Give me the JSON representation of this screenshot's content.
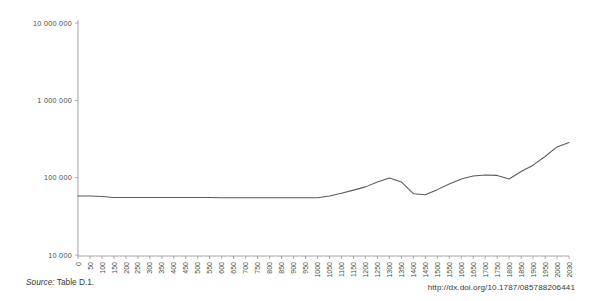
{
  "footer": {
    "source_word": "Source:",
    "source_ref": " Table D.1.",
    "doi": "http://dx.doi.org/10.1787/085788206441"
  },
  "chart_data": {
    "type": "line",
    "title": "",
    "subtitle": "",
    "xlabel": "",
    "ylabel": "",
    "grid": false,
    "legend": null,
    "yscale": "log",
    "ylim": [
      10000,
      10000000
    ],
    "ytick_labels": [
      "10 000 000",
      "1 000 000",
      "100 000",
      "10 000"
    ],
    "ytick_values": [
      10000000,
      1000000,
      100000,
      10000
    ],
    "xlim": [
      0,
      2030
    ],
    "xtick_labels": [
      "0",
      "50",
      "100",
      "150",
      "200",
      "250",
      "300",
      "350",
      "400",
      "450",
      "500",
      "550",
      "600",
      "650",
      "700",
      "750",
      "800",
      "850",
      "900",
      "950",
      "1000",
      "1050",
      "1100",
      "1150",
      "1200",
      "1250",
      "1300",
      "1350",
      "1400",
      "1450",
      "1500",
      "1550",
      "1600",
      "1650",
      "1700",
      "1750",
      "1800",
      "1850",
      "1900",
      "1950",
      "2000",
      "2030"
    ],
    "xtick_values": [
      0,
      50,
      100,
      150,
      200,
      250,
      300,
      350,
      400,
      450,
      500,
      550,
      600,
      650,
      700,
      750,
      800,
      850,
      900,
      950,
      1000,
      1050,
      1100,
      1150,
      1200,
      1250,
      1300,
      1350,
      1400,
      1450,
      1500,
      1550,
      1600,
      1650,
      1700,
      1750,
      1800,
      1850,
      1900,
      1950,
      2000,
      2030
    ],
    "series": [
      {
        "name": "",
        "color": "#5a5a5a",
        "x": [
          0,
          50,
          100,
          150,
          200,
          250,
          300,
          350,
          400,
          450,
          500,
          550,
          600,
          650,
          700,
          750,
          800,
          850,
          900,
          950,
          1000,
          1050,
          1100,
          1150,
          1200,
          1250,
          1300,
          1350,
          1400,
          1450,
          1500,
          1550,
          1600,
          1650,
          1700,
          1750,
          1800,
          1850,
          1900,
          1950,
          2000,
          2030
        ],
        "y": [
          58000,
          58000,
          57000,
          55500,
          55500,
          55500,
          55500,
          55500,
          55500,
          55500,
          55500,
          55500,
          55000,
          55000,
          55000,
          55000,
          55000,
          55000,
          55000,
          55000,
          55000,
          58000,
          63000,
          69000,
          76000,
          88000,
          99000,
          88000,
          62000,
          60000,
          70000,
          83000,
          96000,
          105000,
          108000,
          107000,
          96000,
          120000,
          145000,
          188000,
          250000,
          285000
        ]
      }
    ],
    "annotations": []
  }
}
